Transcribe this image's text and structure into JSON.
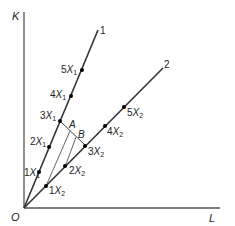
{
  "diagram": {
    "axes": {
      "y_label": "K",
      "x_label": "L",
      "origin_label": "O"
    },
    "rays": [
      {
        "label": "1",
        "points": [
          "1X1",
          "2X1",
          "3X1",
          "4X1",
          "5X1"
        ]
      },
      {
        "label": "2",
        "points": [
          "1X2",
          "2X2",
          "3X2",
          "4X2",
          "5X2"
        ]
      }
    ],
    "markers": {
      "a": "A",
      "b": "B"
    },
    "ray1_points": [
      {
        "coef": "1",
        "var": "X",
        "sub": "1"
      },
      {
        "coef": "2",
        "var": "X",
        "sub": "1"
      },
      {
        "coef": "3",
        "var": "X",
        "sub": "1"
      },
      {
        "coef": "4",
        "var": "X",
        "sub": "1"
      },
      {
        "coef": "5",
        "var": "X",
        "sub": "1"
      }
    ],
    "ray2_points": [
      {
        "coef": "1",
        "var": "X",
        "sub": "2"
      },
      {
        "coef": "2",
        "var": "X",
        "sub": "2"
      },
      {
        "coef": "3",
        "var": "X",
        "sub": "2"
      },
      {
        "coef": "4",
        "var": "X",
        "sub": "2"
      },
      {
        "coef": "5",
        "var": "X",
        "sub": "2"
      }
    ],
    "colors": {
      "line": "#333333",
      "text": "#222222"
    }
  }
}
